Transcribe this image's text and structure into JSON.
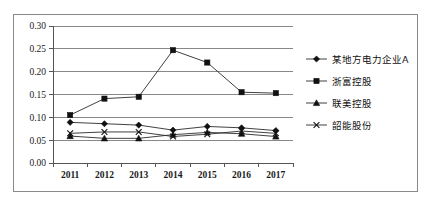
{
  "chart_data": {
    "type": "line",
    "title": "",
    "xlabel": "",
    "ylabel": "",
    "x": [
      "2011",
      "2012",
      "2013",
      "2014",
      "2015",
      "2016",
      "2017"
    ],
    "categories": [
      "2011",
      "2012",
      "2013",
      "2014",
      "2015",
      "2016",
      "2017"
    ],
    "ylim": [
      0.0,
      0.3
    ],
    "yticks": [
      "0.00",
      "0.05",
      "0.10",
      "0.15",
      "0.20",
      "0.25",
      "0.30"
    ],
    "ytick_values": [
      0.0,
      0.05,
      0.1,
      0.15,
      0.2,
      0.25,
      0.3
    ],
    "grid": true,
    "legend_position": "right",
    "series": [
      {
        "name": "某地方电力企业A",
        "marker": "diamond",
        "values": [
          0.089,
          0.086,
          0.083,
          0.072,
          0.08,
          0.077,
          0.071
        ]
      },
      {
        "name": "浙富控股",
        "marker": "square",
        "values": [
          0.105,
          0.141,
          0.145,
          0.247,
          0.22,
          0.155,
          0.153
        ]
      },
      {
        "name": "联美控股",
        "marker": "triangle",
        "values": [
          0.059,
          0.054,
          0.054,
          0.062,
          0.067,
          0.064,
          0.058
        ]
      },
      {
        "name": "韶能股份",
        "marker": "x",
        "values": [
          0.065,
          0.068,
          0.068,
          0.058,
          0.063,
          0.07,
          0.065
        ]
      }
    ]
  },
  "legend": {
    "items": [
      {
        "label": "某地方电力企业A",
        "marker": "diamond"
      },
      {
        "label": "浙富控股",
        "marker": "square"
      },
      {
        "label": "联美控股",
        "marker": "triangle"
      },
      {
        "label": "韶能股份",
        "marker": "x"
      }
    ]
  },
  "colors": {
    "series_stroke": "#2b2b2b",
    "marker_fill": "#111111",
    "gridline": "#888888",
    "axis": "#555555",
    "frame_border": "#8a8a8a",
    "background": "#ffffff"
  }
}
